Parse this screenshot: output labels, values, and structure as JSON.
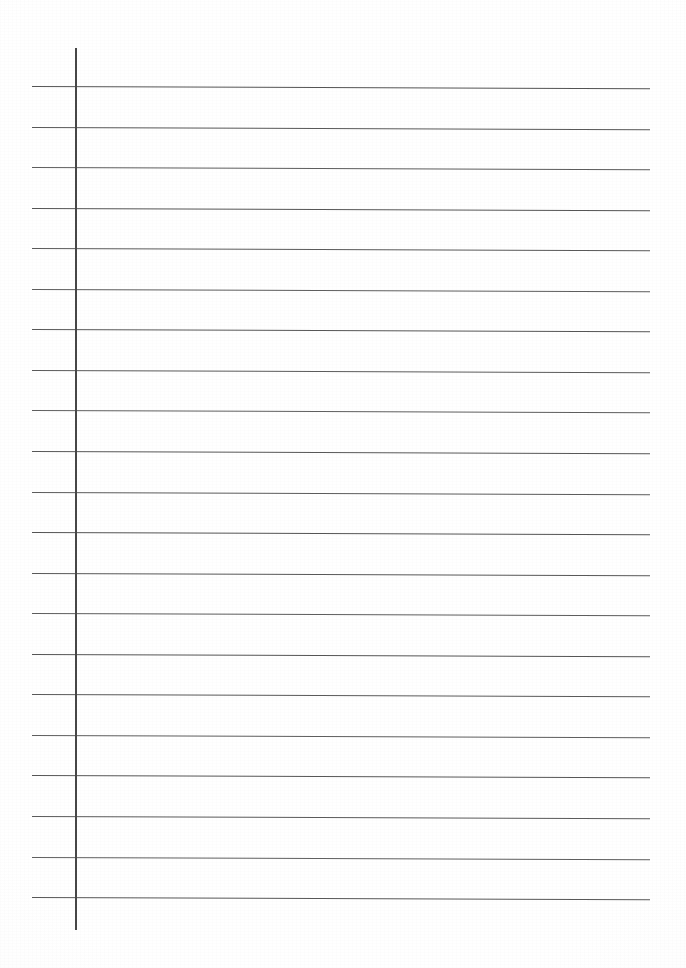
{
  "document": {
    "type": "scanned-lined-notebook-paper",
    "title": "Blank lined paper scan",
    "page_width": 686,
    "page_height": 968,
    "background_color": "#ffffff",
    "paper_tint_color": "#fcfcfc",
    "written_content": "",
    "handwriting_present": "no",
    "printed_text_present": "no"
  },
  "ruling": {
    "line_color": "#5a5a5a",
    "line_thickness": 1.3,
    "line_count": 21,
    "line_left_x": 32,
    "line_right_x": 650,
    "first_line_y": 86,
    "last_line_y": 897,
    "line_spacing": 40.55,
    "skew_degrees": 0.22,
    "line_y_positions": [
      86,
      126.6,
      167.1,
      207.7,
      248.2,
      288.8,
      329.3,
      369.9,
      410.4,
      451,
      491.5,
      532.1,
      572.6,
      613.2,
      653.7,
      694.3,
      734.8,
      775.4,
      815.9,
      856.5,
      897
    ]
  },
  "margin": {
    "color": "#474747",
    "thickness": 2,
    "x": 75,
    "top_y": 48,
    "bottom_y": 930,
    "label": "vertical-margin-rule"
  }
}
